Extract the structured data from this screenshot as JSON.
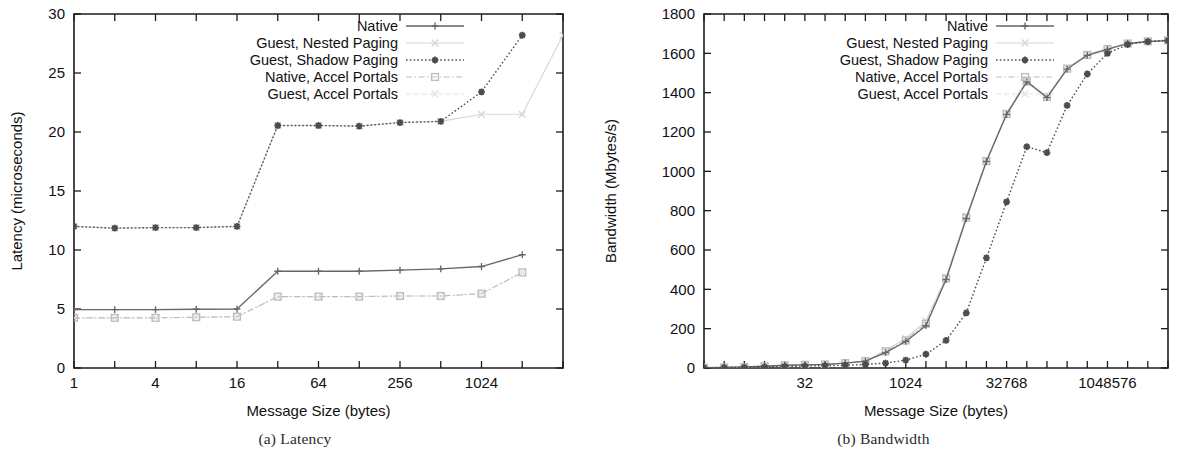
{
  "figure": {
    "panels": [
      {
        "id": "latency",
        "caption_index": "(a)",
        "caption_text": "Latency"
      },
      {
        "id": "bandwidth",
        "caption_index": "(b)",
        "caption_text": "Bandwidth"
      }
    ]
  },
  "legend": {
    "entries": [
      {
        "label": "Native",
        "color": "#666666",
        "dash": "none",
        "marker": "plus",
        "width": 1.3
      },
      {
        "label": "Guest, Nested Paging",
        "color": "#d6d6d6",
        "dash": "none",
        "marker": "cross",
        "width": 1.1
      },
      {
        "label": "Guest, Shadow Paging",
        "color": "#4d4d4d",
        "dash": "dot",
        "marker": "star",
        "width": 1.4
      },
      {
        "label": "Native, Accel Portals",
        "color": "#bdbdbd",
        "dash": "dashdot",
        "marker": "square",
        "width": 1.2
      },
      {
        "label": "Guest, Accel Portals",
        "color": "#e2e2e2",
        "dash": "dash",
        "marker": "xcross",
        "width": 1.1
      }
    ]
  },
  "chart_data": [
    {
      "type": "line",
      "id": "latency",
      "title": "",
      "xlabel": "Message Size (bytes)",
      "ylabel": "Latency (microseconds)",
      "xscale": "log2",
      "xlim": [
        1,
        4096
      ],
      "ylim": [
        0,
        30
      ],
      "yticks": [
        0,
        5,
        10,
        15,
        20,
        25,
        30
      ],
      "ytick_labels": [
        "0",
        "5",
        "10",
        "15",
        "20",
        "25",
        "30"
      ],
      "xticks": [
        1,
        2,
        4,
        8,
        16,
        32,
        64,
        128,
        256,
        512,
        1024,
        2048,
        4096
      ],
      "xtick_labels": [
        "1",
        "",
        "4",
        "",
        "16",
        "",
        "64",
        "",
        "256",
        "",
        "1024",
        "",
        ""
      ],
      "grid": false,
      "legend_position": "top-right-inside",
      "x": [
        1,
        2,
        4,
        8,
        16,
        32,
        64,
        128,
        256,
        512,
        1024,
        2048,
        4096
      ],
      "series": [
        {
          "name": "Native",
          "values": [
            4.95,
            4.95,
            4.95,
            4.98,
            5.0,
            8.2,
            8.2,
            8.2,
            8.3,
            8.4,
            8.6,
            9.6,
            null
          ]
        },
        {
          "name": "Guest, Nested Paging",
          "values": [
            12.0,
            11.85,
            11.9,
            11.9,
            12.0,
            20.55,
            20.55,
            20.5,
            20.8,
            20.9,
            21.5,
            21.5,
            28.2
          ]
        },
        {
          "name": "Guest, Shadow Paging",
          "values": [
            12.0,
            11.85,
            11.9,
            11.9,
            12.0,
            20.55,
            20.55,
            20.5,
            20.8,
            20.9,
            23.4,
            28.2,
            null
          ]
        },
        {
          "name": "Native, Accel Portals",
          "values": [
            4.25,
            4.25,
            4.25,
            4.3,
            4.35,
            6.05,
            6.05,
            6.05,
            6.1,
            6.1,
            6.3,
            8.1,
            null
          ]
        },
        {
          "name": "Guest, Accel Portals",
          "values": [
            4.25,
            4.25,
            4.25,
            4.3,
            4.35,
            6.05,
            6.05,
            6.05,
            6.1,
            6.1,
            6.3,
            8.1,
            null
          ]
        }
      ]
    },
    {
      "type": "line",
      "id": "bandwidth",
      "title": "",
      "xlabel": "Message Size (bytes)",
      "ylabel": "Bandwidth (Mbytes/s)",
      "xscale": "log2",
      "xlim": [
        1,
        8388608
      ],
      "ylim": [
        0,
        1800
      ],
      "yticks": [
        0,
        200,
        400,
        600,
        800,
        1000,
        1200,
        1400,
        1600,
        1800
      ],
      "ytick_labels": [
        "0",
        "200",
        "400",
        "600",
        "800",
        "1000",
        "1200",
        "1400",
        "1600",
        "1800"
      ],
      "xticks": [
        1,
        2,
        4,
        8,
        16,
        32,
        64,
        128,
        256,
        512,
        1024,
        2048,
        4096,
        8192,
        16384,
        32768,
        65536,
        131072,
        262144,
        524288,
        1048576,
        2097152,
        4194304,
        8388608
      ],
      "xtick_labels": [
        "",
        "",
        "",
        "",
        "",
        "32",
        "",
        "",
        "",
        "",
        "1024",
        "",
        "",
        "",
        "",
        "32768",
        "",
        "",
        "",
        "",
        "1048576",
        "",
        "",
        ""
      ],
      "grid": false,
      "legend_position": "top-right-inside",
      "x": [
        1,
        2,
        4,
        8,
        16,
        32,
        64,
        128,
        256,
        512,
        1024,
        2048,
        4096,
        8192,
        16384,
        32768,
        65536,
        131072,
        262144,
        524288,
        1048576,
        2097152,
        4194304,
        8388608
      ],
      "series": [
        {
          "name": "Native",
          "values": [
            2,
            3,
            5,
            9,
            14,
            16,
            18,
            25,
            35,
            78,
            135,
            215,
            450,
            760,
            1050,
            1290,
            1455,
            1375,
            1520,
            1590,
            1620,
            1650,
            1660,
            1665
          ]
        },
        {
          "name": "Guest, Nested Paging",
          "values": [
            2,
            3,
            5,
            9,
            14,
            16,
            18,
            25,
            35,
            90,
            150,
            240,
            460,
            770,
            1055,
            1295,
            1460,
            1380,
            1525,
            1595,
            1625,
            1652,
            1662,
            1668
          ]
        },
        {
          "name": "Guest, Shadow Paging",
          "values": [
            1,
            2,
            3,
            5,
            8,
            10,
            12,
            14,
            18,
            25,
            40,
            70,
            140,
            280,
            560,
            845,
            1125,
            1095,
            1335,
            1495,
            1600,
            1645,
            1660,
            1665
          ]
        },
        {
          "name": "Native, Accel Portals",
          "values": [
            2,
            3,
            5,
            9,
            14,
            16,
            18,
            25,
            35,
            85,
            140,
            225,
            455,
            765,
            1052,
            1292,
            1458,
            1378,
            1522,
            1592,
            1622,
            1650,
            1661,
            1666
          ]
        },
        {
          "name": "Guest, Accel Portals",
          "values": [
            2,
            3,
            5,
            9,
            14,
            16,
            18,
            25,
            35,
            88,
            145,
            230,
            458,
            768,
            1054,
            1294,
            1459,
            1379,
            1524,
            1594,
            1624,
            1651,
            1662,
            1667
          ]
        }
      ]
    }
  ]
}
